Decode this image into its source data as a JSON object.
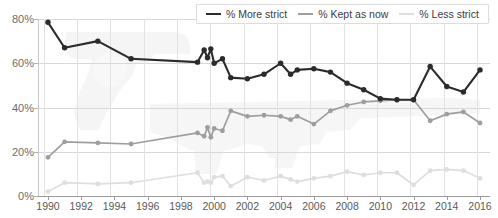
{
  "chart_data": {
    "type": "line",
    "title": "",
    "subtitle": "",
    "xlabel": "",
    "ylabel": "",
    "xlim": [
      1989.4,
      2016.6
    ],
    "ylim": [
      0,
      80
    ],
    "yticks": [
      0,
      20,
      40,
      60,
      80
    ],
    "ytick_labels": [
      "0%",
      "20%",
      "40%",
      "60%",
      "80%"
    ],
    "xticks": [
      1990,
      1992,
      1994,
      1996,
      1998,
      2000,
      2002,
      2004,
      2006,
      2008,
      2010,
      2012,
      2014,
      2016
    ],
    "xtick_labels": [
      "1990",
      "1992",
      "1994",
      "1996",
      "1998",
      "2000",
      "2002",
      "2004",
      "2006",
      "2008",
      "2010",
      "2012",
      "2014",
      "2016"
    ],
    "grid": true,
    "grid_axis": "both",
    "legend_position": "top-center",
    "markers": true,
    "series": [
      {
        "name": "% More strict",
        "color": "#2b2b2b",
        "points": [
          [
            1990.0,
            78.5
          ],
          [
            1991.0,
            67.0
          ],
          [
            1993.0,
            70.0
          ],
          [
            1995.0,
            62.0
          ],
          [
            1999.0,
            60.5
          ],
          [
            1999.4,
            66.0
          ],
          [
            1999.6,
            62.5
          ],
          [
            1999.8,
            66.5
          ],
          [
            2000.0,
            60.0
          ],
          [
            2000.5,
            62.0
          ],
          [
            2001.0,
            53.5
          ],
          [
            2002.0,
            53.0
          ],
          [
            2003.0,
            55.0
          ],
          [
            2004.0,
            60.0
          ],
          [
            2004.6,
            55.0
          ],
          [
            2005.0,
            57.0
          ],
          [
            2006.0,
            57.5
          ],
          [
            2007.0,
            56.0
          ],
          [
            2008.0,
            51.0
          ],
          [
            2009.0,
            48.0
          ],
          [
            2010.0,
            44.0
          ],
          [
            2011.0,
            43.5
          ],
          [
            2012.0,
            43.5
          ],
          [
            2013.0,
            58.5
          ],
          [
            2014.0,
            49.5
          ],
          [
            2015.0,
            47.0
          ],
          [
            2016.0,
            57.0
          ]
        ]
      },
      {
        "name": "% Kept as now",
        "color": "#9e9e9e",
        "points": [
          [
            1990.0,
            17.5
          ],
          [
            1991.0,
            24.5
          ],
          [
            1993.0,
            24.0
          ],
          [
            1995.0,
            23.5
          ],
          [
            1999.0,
            28.5
          ],
          [
            1999.4,
            27.0
          ],
          [
            1999.6,
            31.0
          ],
          [
            1999.8,
            26.5
          ],
          [
            2000.0,
            30.5
          ],
          [
            2000.5,
            29.5
          ],
          [
            2001.0,
            38.5
          ],
          [
            2002.0,
            36.0
          ],
          [
            2003.0,
            36.5
          ],
          [
            2004.0,
            36.0
          ],
          [
            2004.6,
            34.5
          ],
          [
            2005.0,
            36.0
          ],
          [
            2006.0,
            32.5
          ],
          [
            2007.0,
            38.5
          ],
          [
            2008.0,
            41.0
          ],
          [
            2009.0,
            42.5
          ],
          [
            2010.0,
            43.0
          ],
          [
            2011.0,
            43.5
          ],
          [
            2012.0,
            43.5
          ],
          [
            2013.0,
            34.0
          ],
          [
            2014.0,
            37.0
          ],
          [
            2015.0,
            38.0
          ],
          [
            2016.0,
            33.0
          ]
        ]
      },
      {
        "name": "% Less strict",
        "color": "#dedede",
        "points": [
          [
            1990.0,
            2.0
          ],
          [
            1991.0,
            6.0
          ],
          [
            1993.0,
            5.5
          ],
          [
            1995.0,
            6.0
          ],
          [
            1999.0,
            10.5
          ],
          [
            1999.4,
            6.0
          ],
          [
            1999.6,
            6.5
          ],
          [
            1999.8,
            6.0
          ],
          [
            2000.0,
            8.5
          ],
          [
            2000.5,
            9.0
          ],
          [
            2001.0,
            4.5
          ],
          [
            2002.0,
            8.5
          ],
          [
            2003.0,
            7.0
          ],
          [
            2004.0,
            9.0
          ],
          [
            2004.6,
            7.5
          ],
          [
            2005.0,
            6.5
          ],
          [
            2006.0,
            8.0
          ],
          [
            2007.0,
            9.0
          ],
          [
            2008.0,
            11.0
          ],
          [
            2009.0,
            9.5
          ],
          [
            2010.0,
            10.5
          ],
          [
            2011.0,
            10.5
          ],
          [
            2012.0,
            5.0
          ],
          [
            2013.0,
            11.5
          ],
          [
            2014.0,
            12.0
          ],
          [
            2015.0,
            11.5
          ],
          [
            2016.0,
            8.0
          ]
        ]
      }
    ]
  },
  "legend": {
    "items": [
      {
        "label": "% More strict",
        "color": "#2b2b2b"
      },
      {
        "label": "% Kept as now",
        "color": "#9e9e9e"
      },
      {
        "label": "% Less strict",
        "color": "#dedede"
      }
    ]
  },
  "watermark": {
    "pistol_icon": "pistol-silhouette-icon",
    "rifle_icon": "rifle-silhouette-icon",
    "color": "#ebebeb"
  }
}
